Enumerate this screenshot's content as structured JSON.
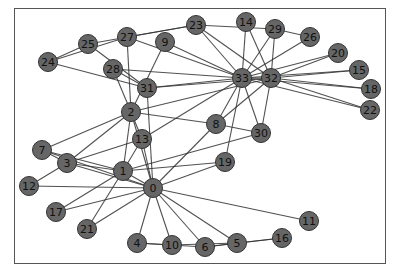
{
  "graph": {
    "title": "",
    "node_color": "#666666",
    "edge_color": "#333333",
    "nodes": [
      {
        "id": "0",
        "x": 153,
        "y": 188
      },
      {
        "id": "1",
        "x": 123,
        "y": 171
      },
      {
        "id": "2",
        "x": 131,
        "y": 112
      },
      {
        "id": "3",
        "x": 67,
        "y": 163
      },
      {
        "id": "4",
        "x": 137,
        "y": 243
      },
      {
        "id": "5",
        "x": 237,
        "y": 243
      },
      {
        "id": "6",
        "x": 205,
        "y": 247
      },
      {
        "id": "7",
        "x": 42,
        "y": 150
      },
      {
        "id": "8",
        "x": 216,
        "y": 124
      },
      {
        "id": "9",
        "x": 165,
        "y": 42
      },
      {
        "id": "10",
        "x": 172,
        "y": 245
      },
      {
        "id": "11",
        "x": 309,
        "y": 221
      },
      {
        "id": "12",
        "x": 29,
        "y": 186
      },
      {
        "id": "13",
        "x": 142,
        "y": 139
      },
      {
        "id": "14",
        "x": 246,
        "y": 22
      },
      {
        "id": "15",
        "x": 359,
        "y": 70
      },
      {
        "id": "16",
        "x": 282,
        "y": 238
      },
      {
        "id": "17",
        "x": 56,
        "y": 212
      },
      {
        "id": "18",
        "x": 371,
        "y": 89
      },
      {
        "id": "19",
        "x": 225,
        "y": 162
      },
      {
        "id": "20",
        "x": 338,
        "y": 53
      },
      {
        "id": "21",
        "x": 87,
        "y": 229
      },
      {
        "id": "22",
        "x": 370,
        "y": 110
      },
      {
        "id": "23",
        "x": 196,
        "y": 25
      },
      {
        "id": "24",
        "x": 48,
        "y": 62
      },
      {
        "id": "25",
        "x": 88,
        "y": 44
      },
      {
        "id": "26",
        "x": 310,
        "y": 37
      },
      {
        "id": "27",
        "x": 127,
        "y": 37
      },
      {
        "id": "28",
        "x": 113,
        "y": 69
      },
      {
        "id": "29",
        "x": 275,
        "y": 29
      },
      {
        "id": "30",
        "x": 261,
        "y": 133
      },
      {
        "id": "31",
        "x": 147,
        "y": 88
      },
      {
        "id": "32",
        "x": 271,
        "y": 78
      },
      {
        "id": "33",
        "x": 242,
        "y": 78
      }
    ],
    "edges": [
      [
        0,
        1
      ],
      [
        0,
        2
      ],
      [
        0,
        3
      ],
      [
        0,
        4
      ],
      [
        0,
        5
      ],
      [
        0,
        6
      ],
      [
        0,
        7
      ],
      [
        0,
        8
      ],
      [
        0,
        10
      ],
      [
        0,
        11
      ],
      [
        0,
        12
      ],
      [
        0,
        13
      ],
      [
        0,
        17
      ],
      [
        0,
        19
      ],
      [
        0,
        21
      ],
      [
        0,
        31
      ],
      [
        1,
        2
      ],
      [
        1,
        3
      ],
      [
        1,
        7
      ],
      [
        1,
        13
      ],
      [
        1,
        17
      ],
      [
        1,
        19
      ],
      [
        1,
        21
      ],
      [
        1,
        30
      ],
      [
        2,
        3
      ],
      [
        2,
        7
      ],
      [
        2,
        8
      ],
      [
        2,
        9
      ],
      [
        2,
        13
      ],
      [
        2,
        27
      ],
      [
        2,
        28
      ],
      [
        2,
        32
      ],
      [
        3,
        7
      ],
      [
        3,
        12
      ],
      [
        3,
        13
      ],
      [
        4,
        6
      ],
      [
        4,
        10
      ],
      [
        5,
        6
      ],
      [
        5,
        10
      ],
      [
        5,
        16
      ],
      [
        6,
        16
      ],
      [
        8,
        30
      ],
      [
        8,
        32
      ],
      [
        8,
        33
      ],
      [
        9,
        33
      ],
      [
        13,
        33
      ],
      [
        14,
        32
      ],
      [
        14,
        33
      ],
      [
        15,
        32
      ],
      [
        15,
        33
      ],
      [
        18,
        32
      ],
      [
        18,
        33
      ],
      [
        19,
        33
      ],
      [
        20,
        32
      ],
      [
        20,
        33
      ],
      [
        22,
        32
      ],
      [
        22,
        33
      ],
      [
        23,
        25
      ],
      [
        23,
        27
      ],
      [
        23,
        29
      ],
      [
        23,
        32
      ],
      [
        23,
        33
      ],
      [
        24,
        25
      ],
      [
        24,
        27
      ],
      [
        24,
        31
      ],
      [
        25,
        31
      ],
      [
        26,
        29
      ],
      [
        26,
        33
      ],
      [
        27,
        33
      ],
      [
        28,
        31
      ],
      [
        28,
        33
      ],
      [
        29,
        32
      ],
      [
        29,
        33
      ],
      [
        30,
        32
      ],
      [
        30,
        33
      ],
      [
        31,
        32
      ],
      [
        31,
        33
      ],
      [
        32,
        33
      ]
    ]
  }
}
